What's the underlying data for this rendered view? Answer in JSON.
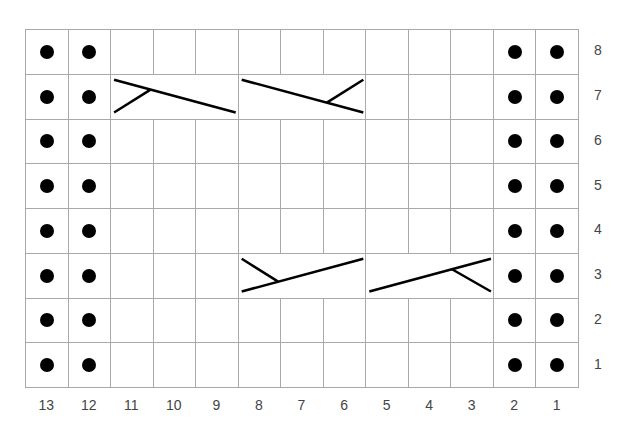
{
  "chart": {
    "type": "knitting-chart",
    "columns": 13,
    "rows": 8,
    "grid": {
      "left": 25,
      "top": 29,
      "right": 578,
      "bottom": 387
    },
    "grid_color": "#a9a9a9",
    "symbol_color": "#000000",
    "column_labels": [
      "13",
      "12",
      "11",
      "10",
      "9",
      "8",
      "7",
      "6",
      "5",
      "4",
      "3",
      "2",
      "1"
    ],
    "row_labels": [
      "8",
      "7",
      "6",
      "5",
      "4",
      "3",
      "2",
      "1"
    ],
    "purl_columns": [
      13,
      12,
      2,
      1
    ],
    "purl_symbol": "dot",
    "cables": [
      {
        "row": 7,
        "from_col": 11,
        "to_col": 9,
        "type": "left-cross",
        "symbol": "cable-left"
      },
      {
        "row": 7,
        "from_col": 8,
        "to_col": 6,
        "type": "right-cross",
        "symbol": "cable-right"
      },
      {
        "row": 3,
        "from_col": 8,
        "to_col": 6,
        "type": "left-cross",
        "symbol": "cable-left"
      },
      {
        "row": 3,
        "from_col": 5,
        "to_col": 3,
        "type": "right-cross",
        "symbol": "cable-right"
      }
    ]
  }
}
